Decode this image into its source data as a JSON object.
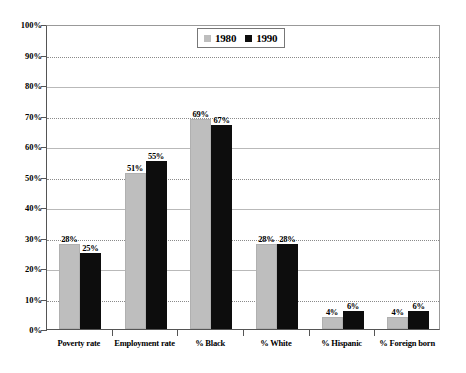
{
  "chart_data": {
    "type": "bar",
    "title": "",
    "subtitle": "",
    "xlabel": "",
    "ylabel": "",
    "ylim": [
      0,
      100
    ],
    "ytick_labels": [
      "100%",
      "90%",
      "80%",
      "70%",
      "60%",
      "50%",
      "40%",
      "30%",
      "20%",
      "10%",
      "0%"
    ],
    "ytick_values": [
      100,
      90,
      80,
      70,
      60,
      50,
      40,
      30,
      20,
      10,
      0
    ],
    "grid": true,
    "grid_axis": "y",
    "legend_position": "top-center",
    "categories": [
      "Poverty rate",
      "Employment rate",
      "% Black",
      "% White",
      "% Hispanic",
      "% Foreign born"
    ],
    "series": [
      {
        "name": "1980",
        "color": "#bebebe",
        "values": [
          28,
          51,
          69,
          28,
          4,
          4
        ],
        "labels": [
          "28%",
          "51%",
          "69%",
          "28%",
          "4%",
          "4%"
        ]
      },
      {
        "name": "1990",
        "color": "#0d0d0d",
        "values": [
          25,
          55,
          67,
          28,
          6,
          6
        ],
        "labels": [
          "25%",
          "55%",
          "67%",
          "28%",
          "6%",
          "6%"
        ]
      }
    ]
  },
  "legend": {
    "items": [
      {
        "label": "1980",
        "swatch": "legend-swatch-1980"
      },
      {
        "label": "1990",
        "swatch": "legend-swatch-1990"
      }
    ]
  }
}
